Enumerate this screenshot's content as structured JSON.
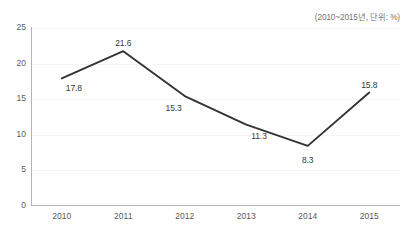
{
  "chart": {
    "title": "",
    "subtitle": "(2010~2015년, 단위: %)"
  },
  "chart_data": {
    "type": "line",
    "title": "",
    "subtitle": "(2010~2015년, 단위: %)",
    "xlabel": "",
    "ylabel": "",
    "unit": "%",
    "period": "2010~2015",
    "categories": [
      "2010",
      "2011",
      "2012",
      "2013",
      "2014",
      "2015"
    ],
    "values": [
      17.8,
      21.6,
      15.3,
      11.3,
      8.3,
      15.8
    ],
    "point_labels": [
      "17.8",
      "21.6",
      "15.3",
      "11.3",
      "8.3",
      "15.8"
    ],
    "ylim": [
      0,
      25
    ],
    "yticks": [
      0,
      5,
      10,
      15,
      20,
      25
    ],
    "ytick_labels": [
      "0",
      "5",
      "10",
      "15",
      "20",
      "25"
    ],
    "grid": true,
    "legend": false,
    "markers": false,
    "series": [
      {
        "name": "",
        "values": [
          17.8,
          21.6,
          15.3,
          11.3,
          8.3,
          15.8
        ],
        "color": "#333333"
      }
    ],
    "colors": {
      "line": "#333333",
      "axis": "#b4b4b4",
      "grid": "#f4f4f4",
      "tick_text": "#5a5a5a",
      "label_text": "#383838",
      "subtitle_text": "#757575",
      "background": "#ffffff"
    }
  }
}
